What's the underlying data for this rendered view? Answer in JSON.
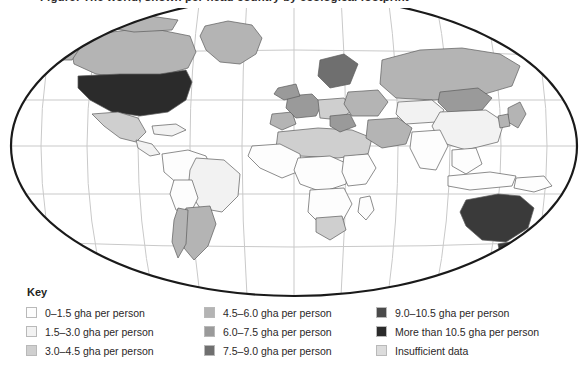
{
  "title": "Figure: The world, shown per head country by ecological footprint",
  "map": {
    "projection": "mollweide-ellipse",
    "outline_color": "#1a1a1a",
    "graticule_color": "#c9c9c9",
    "country_border_color": "#5b5b5b",
    "ocean_color": "#ffffff",
    "regions": [
      {
        "name": "united-states",
        "class": "v8"
      },
      {
        "name": "canada",
        "class": "v5"
      },
      {
        "name": "greenland",
        "class": "v5"
      },
      {
        "name": "mexico",
        "class": "v3"
      },
      {
        "name": "central-america",
        "class": "v2"
      },
      {
        "name": "caribbean",
        "class": "v2"
      },
      {
        "name": "brazil",
        "class": "v2"
      },
      {
        "name": "argentina",
        "class": "v4"
      },
      {
        "name": "chile",
        "class": "v4"
      },
      {
        "name": "northern-south-america",
        "class": "v1"
      },
      {
        "name": "western-europe",
        "class": "v6"
      },
      {
        "name": "scandinavia",
        "class": "v7"
      },
      {
        "name": "united-kingdom-ireland",
        "class": "v6"
      },
      {
        "name": "iberia",
        "class": "v5"
      },
      {
        "name": "eastern-europe",
        "class": "v4"
      },
      {
        "name": "russia",
        "class": "v5"
      },
      {
        "name": "mongolia",
        "class": "v6"
      },
      {
        "name": "china",
        "class": "v2"
      },
      {
        "name": "india",
        "class": "v1"
      },
      {
        "name": "south-east-asia",
        "class": "v1"
      },
      {
        "name": "japan",
        "class": "v4"
      },
      {
        "name": "middle-east",
        "class": "v4"
      },
      {
        "name": "north-africa",
        "class": "v2"
      },
      {
        "name": "sub-saharan-africa",
        "class": "v1"
      },
      {
        "name": "south-africa",
        "class": "v3"
      },
      {
        "name": "australia",
        "class": "v9"
      },
      {
        "name": "new-zealand",
        "class": "v6"
      },
      {
        "name": "indonesia",
        "class": "v1"
      },
      {
        "name": "papua-new-guinea",
        "class": "v1"
      }
    ]
  },
  "legend": {
    "heading": "Key",
    "columns": [
      {
        "items": [
          {
            "label": "0–1.5 gha per person",
            "color": "#fdfdfd"
          },
          {
            "label": "1.5–3.0 gha per person",
            "color": "#f2f2f2"
          },
          {
            "label": "3.0–4.5 gha per person",
            "color": "#cfcfcf"
          }
        ]
      },
      {
        "items": [
          {
            "label": "4.5–6.0 gha per person",
            "color": "#b4b4b4"
          },
          {
            "label": "6.0–7.5 gha per person",
            "color": "#9a9a9a"
          },
          {
            "label": "7.5–9.0 gha per person",
            "color": "#6f6f6f"
          }
        ]
      },
      {
        "items": [
          {
            "label": "9.0–10.5 gha per person",
            "color": "#4a4a4a"
          },
          {
            "label": "More than 10.5 gha per person",
            "color": "#2b2b2b"
          },
          {
            "label": "Insufficient data",
            "color": "#dcdcdc"
          }
        ]
      }
    ]
  }
}
